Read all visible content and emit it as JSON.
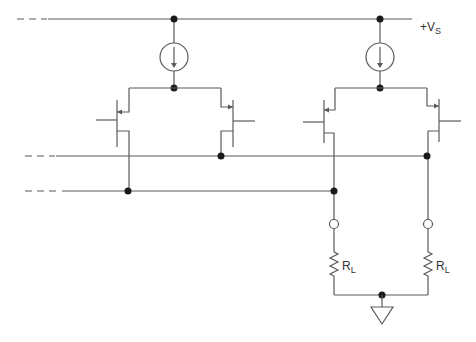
{
  "diagram": {
    "type": "circuit-schematic",
    "colors": {
      "wire": "#5a5a5a",
      "node": "#1a1a1a",
      "background": "#ffffff"
    },
    "labels": {
      "supply": {
        "prefix": "+V",
        "sub": "S"
      },
      "load_left": {
        "prefix": "R",
        "sub": "L"
      },
      "load_right": {
        "prefix": "R",
        "sub": "L"
      }
    },
    "components": [
      {
        "id": "I1",
        "kind": "current-source",
        "direction": "down"
      },
      {
        "id": "I2",
        "kind": "current-source",
        "direction": "down"
      },
      {
        "id": "Q1",
        "kind": "pnp-transistor"
      },
      {
        "id": "Q2",
        "kind": "pnp-transistor"
      },
      {
        "id": "Q3",
        "kind": "pnp-transistor"
      },
      {
        "id": "Q4",
        "kind": "pnp-transistor"
      },
      {
        "id": "RL1",
        "kind": "resistor",
        "label": "RL"
      },
      {
        "id": "RL2",
        "kind": "resistor",
        "label": "RL"
      },
      {
        "id": "GND",
        "kind": "ground"
      }
    ]
  }
}
